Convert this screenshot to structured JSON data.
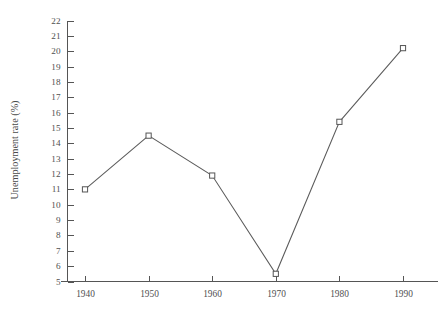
{
  "chart_data": {
    "type": "line",
    "title": "",
    "subtitle": "",
    "xlabel": "",
    "ylabel": "Unemployment rate (%)",
    "x": [
      1940,
      1950,
      1960,
      1970,
      1980,
      1990
    ],
    "categories": [
      "1940",
      "1950",
      "1960",
      "1970",
      "1980",
      "1990"
    ],
    "values": [
      11.0,
      14.5,
      11.9,
      5.5,
      15.4,
      20.2
    ],
    "series": [
      {
        "name": "Unemployment rate",
        "values": [
          11.0,
          14.5,
          11.9,
          5.5,
          15.4,
          20.2
        ]
      }
    ],
    "xlim": [
      1935,
      1995
    ],
    "ylim": [
      5,
      22
    ],
    "xticks": [
      "1940",
      "1950",
      "1960",
      "1970",
      "1980",
      "1990"
    ],
    "yticks": [
      "5",
      "6",
      "7",
      "8",
      "9",
      "10",
      "11",
      "12",
      "13",
      "14",
      "15",
      "16",
      "17",
      "18",
      "19",
      "20",
      "21",
      "22"
    ],
    "grid": false,
    "legend": false,
    "legend_position": "none",
    "marker": "open-square",
    "line_color": "#5b5b5b",
    "marker_fill": "#ffffff",
    "marker_stroke": "#555555",
    "axis_color": "#555555",
    "background_color": "#ffffff",
    "annotations": []
  }
}
